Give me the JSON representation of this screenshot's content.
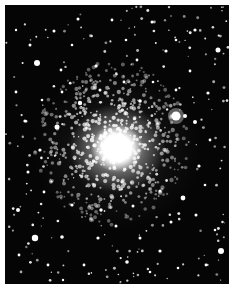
{
  "image": {
    "subject": "globular star cluster",
    "description": "Grayscale photograph of a dense globular star cluster: a bright white core slightly left of center, surrounded by a halo of many resolved stars on a black background; a bright foreground star to the right of the core.",
    "colors": {
      "background": "#050505",
      "stars": "#ffffff",
      "border": "#ffffff"
    },
    "core": {
      "cx": 112,
      "cy": 143
    },
    "bright_star": {
      "cx": 176,
      "cy": 116,
      "r": 4.5
    }
  },
  "stars": [
    [
      37,
      63,
      3
    ],
    [
      57,
      127,
      2.5
    ],
    [
      35,
      238,
      3.2
    ],
    [
      221,
      251,
      3
    ],
    [
      218,
      50,
      2.5
    ],
    [
      183,
      198,
      2.4
    ],
    [
      185,
      116,
      2
    ],
    [
      80,
      103,
      2.2
    ],
    [
      140,
      101,
      1.8
    ],
    [
      195,
      122,
      2
    ],
    [
      25,
      121,
      1.6
    ],
    [
      62,
      237,
      1.8
    ],
    [
      98,
      238,
      1.6
    ],
    [
      127,
      262,
      1.8
    ],
    [
      160,
      251,
      1.6
    ],
    [
      18,
      210,
      2
    ],
    [
      54,
      31,
      1.5
    ],
    [
      78,
      19,
      1.5
    ],
    [
      112,
      20,
      1.4
    ],
    [
      152,
      22,
      1.5
    ],
    [
      195,
      30,
      1.6
    ],
    [
      30,
      45,
      1.5
    ],
    [
      166,
      51,
      1.6
    ],
    [
      137,
      60,
      1.4
    ],
    [
      96,
      66,
      1.5
    ],
    [
      61,
      70,
      1.4
    ],
    [
      199,
      166,
      1.6
    ],
    [
      208,
      93,
      1.6
    ],
    [
      16,
      92,
      1.4
    ],
    [
      40,
      150,
      1.6
    ],
    [
      28,
      172,
      1.5
    ],
    [
      44,
      192,
      1.4
    ],
    [
      72,
      205,
      1.6
    ],
    [
      101,
      210,
      1.7
    ],
    [
      133,
      206,
      1.5
    ],
    [
      160,
      191,
      1.6
    ],
    [
      171,
      222,
      1.5
    ],
    [
      196,
      215,
      1.5
    ],
    [
      206,
      265,
      1.4
    ],
    [
      140,
      238,
      1.5
    ],
    [
      84,
      265,
      1.4
    ],
    [
      48,
      265,
      1.4
    ],
    [
      19,
      255,
      1.4
    ],
    [
      116,
      226,
      1.5
    ],
    [
      190,
      71,
      1.4
    ],
    [
      210,
      140,
      1.4
    ],
    [
      72,
      45,
      1.3
    ],
    [
      126,
      40,
      1.3
    ],
    [
      176,
      40,
      1.3
    ],
    [
      16,
      30,
      1.2
    ],
    [
      124,
      82,
      1.4
    ],
    [
      153,
      82,
      1.3
    ],
    [
      100,
      90,
      1.5
    ],
    [
      62,
      92,
      1.4
    ],
    [
      42,
      100,
      1.3
    ],
    [
      176,
      90,
      1.4
    ],
    [
      205,
      185,
      1.3
    ],
    [
      215,
      230,
      1.3
    ],
    [
      178,
      268,
      1.3
    ],
    [
      63,
      280,
      1.2
    ],
    [
      150,
      272,
      1.3
    ]
  ]
}
